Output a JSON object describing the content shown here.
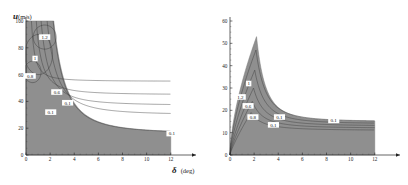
{
  "figure": {
    "background": "#ffffff",
    "panel_count": 2
  },
  "chart_data": [
    {
      "id": "left",
      "type": "contour",
      "title": "",
      "subtitle": "",
      "xlabel": "δ (deg)",
      "xlabel_symbol": "δ",
      "xlabel_unit": "(deg)",
      "ylabel": "u (m/s)",
      "ylabel_symbol": "u",
      "ylabel_sub": "",
      "ylabel_unit": "(m/s)",
      "xlim": [
        0,
        12.6
      ],
      "ylim": [
        0,
        100
      ],
      "xticks": [
        0,
        2,
        4,
        6,
        8,
        10,
        12
      ],
      "xticklabels": [
        "0",
        "2",
        "4",
        "6",
        "8",
        "10",
        "12"
      ],
      "yticks": [
        0,
        20,
        40,
        60,
        80,
        100
      ],
      "yticklabels": [
        "0",
        "20",
        "40",
        "60",
        "80",
        "100"
      ],
      "grid": false,
      "legend": "none",
      "shaded_region_color": "#8f8f8f",
      "shaded_region_label": "feasible region",
      "contour_levels": [
        0.1,
        0.6,
        0.8,
        1,
        1.2
      ],
      "contour_labels": [
        {
          "text": "1.2",
          "x": 1.55,
          "y": 88
        },
        {
          "text": "1",
          "x": 0.75,
          "y": 72
        },
        {
          "text": "0.8",
          "x": 0.35,
          "y": 59
        },
        {
          "text": "0.6",
          "x": 2.55,
          "y": 47
        },
        {
          "text": "0.1",
          "x": 3.45,
          "y": 39
        },
        {
          "text": "0.1",
          "x": 2.05,
          "y": 32
        },
        {
          "text": "0.1",
          "x": 12.1,
          "y": 16
        }
      ],
      "boundary_description": "L-shaped feasible envelope: vertical left edge at delta=0 from u=0 to u=100, top edge to delta=2.3 at u=100, then decaying hyperbolic curve down to u=16 at delta=12, vertical drop to u=0 at delta=12"
    },
    {
      "id": "right",
      "type": "contour",
      "title": "",
      "subtitle": "",
      "xlabel": "δ (deg)",
      "xlabel_symbol": "δ",
      "xlabel_unit": "(deg)",
      "ylabel": "a_y (m/s²)",
      "ylabel_symbol": "a",
      "ylabel_sub": "y",
      "ylabel_unit": "(m/s²)",
      "xlim": [
        0,
        12.6
      ],
      "ylim": [
        0,
        60
      ],
      "xticks": [
        0,
        2,
        4,
        6,
        8,
        10,
        12
      ],
      "xticklabels": [
        "0",
        "2",
        "4",
        "6",
        "8",
        "10",
        "12"
      ],
      "yticks": [
        0,
        10,
        20,
        30,
        40,
        50,
        60
      ],
      "yticklabels": [
        "0",
        "10",
        "20",
        "30",
        "40",
        "50",
        "60"
      ],
      "grid": false,
      "legend": "none",
      "shaded_region_color": "#8f8f8f",
      "shaded_region_label": "feasible region",
      "contour_levels": [
        0.1,
        0.6,
        0.8,
        1,
        1.2
      ],
      "contour_labels": [
        {
          "text": "1",
          "x": 1.55,
          "y": 32
        },
        {
          "text": "1.2",
          "x": 0.85,
          "y": 26
        },
        {
          "text": "0.6",
          "x": 1.5,
          "y": 22
        },
        {
          "text": "0.8",
          "x": 1.9,
          "y": 17
        },
        {
          "text": "0.1",
          "x": 4.1,
          "y": 17
        },
        {
          "text": "0.1",
          "x": 3.6,
          "y": 13.5
        },
        {
          "text": "0.1",
          "x": 8.6,
          "y": 15.5
        }
      ],
      "boundary_description": "Peak near delta=2.2 at a_y=53 rising steeply from origin, then decaying to a plateau near a_y=15 extending to delta=12, closed by vertical drop to zero"
    }
  ]
}
